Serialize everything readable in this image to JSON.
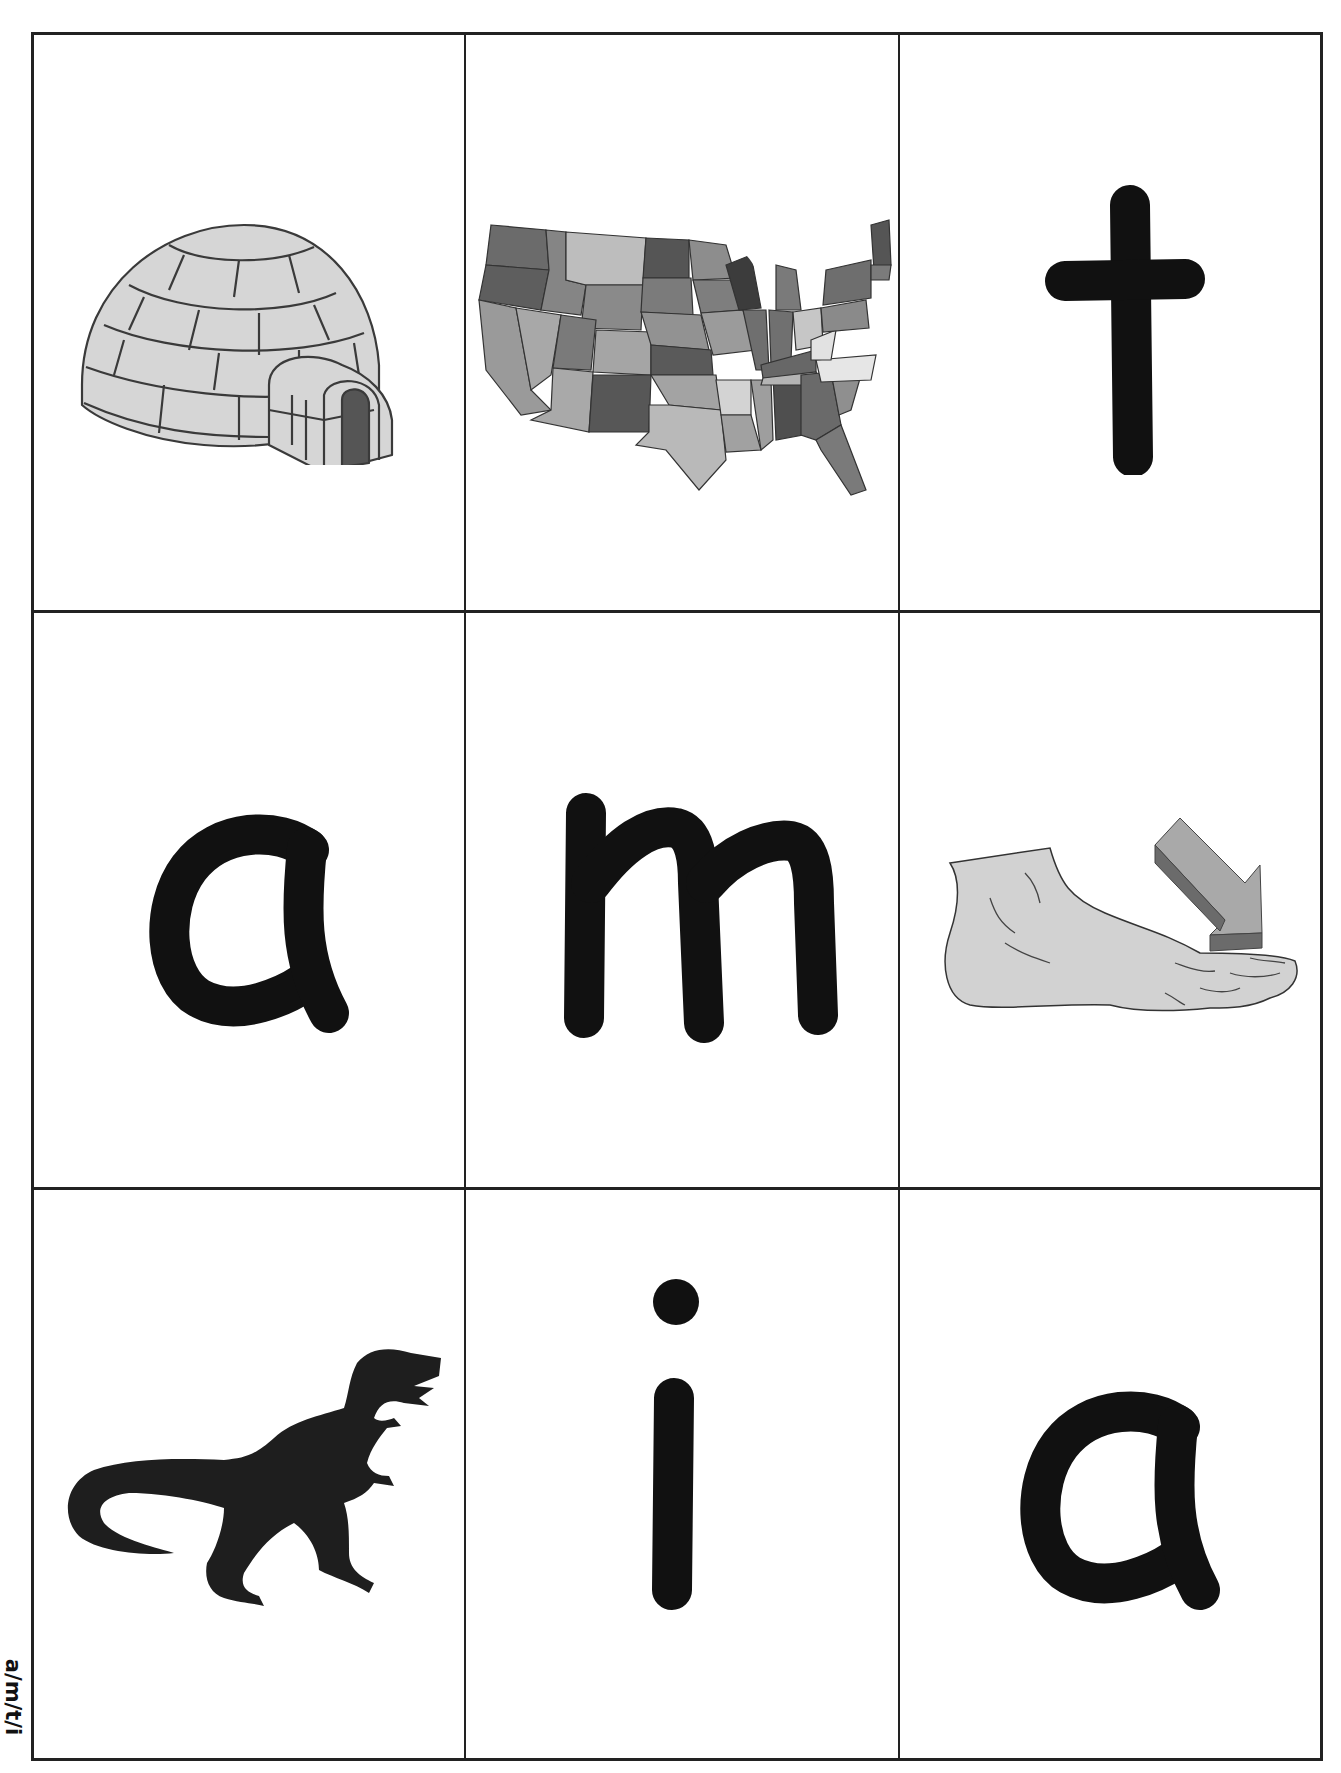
{
  "worksheet": {
    "side_label": "a/m/t/i",
    "border_color": "#222222",
    "ink_color": "#111111",
    "cards": [
      {
        "row": 1,
        "col": 1,
        "type": "picture",
        "subject": "igloo",
        "icon": "igloo-icon"
      },
      {
        "row": 1,
        "col": 2,
        "type": "picture",
        "subject": "map of the United States",
        "icon": "usa-map-icon"
      },
      {
        "row": 1,
        "col": 3,
        "type": "letter",
        "letter": "t"
      },
      {
        "row": 2,
        "col": 1,
        "type": "letter",
        "letter": "a"
      },
      {
        "row": 2,
        "col": 2,
        "type": "letter",
        "letter": "m"
      },
      {
        "row": 2,
        "col": 3,
        "type": "picture",
        "subject": "foot with arrow pointing to toes",
        "icon": "foot-toes-icon"
      },
      {
        "row": 3,
        "col": 1,
        "type": "picture",
        "subject": "dinosaur silhouette",
        "icon": "dinosaur-icon"
      },
      {
        "row": 3,
        "col": 2,
        "type": "letter",
        "letter": "i"
      },
      {
        "row": 3,
        "col": 3,
        "type": "letter",
        "letter": "a"
      }
    ]
  }
}
